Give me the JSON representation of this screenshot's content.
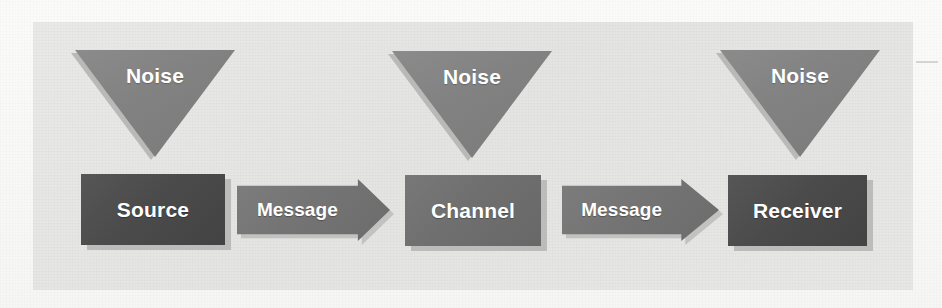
{
  "diagram": {
    "type": "flow-diagram",
    "colors": {
      "page_background": "#fbfbfa",
      "panel_background": "#e6e6e5",
      "node_dark": "#4b4b4b",
      "node_mid": "#6f6f6f",
      "noise_triangle": "#828282",
      "arrow": "#747474",
      "label_text": "#ffffff",
      "shadow": "#bcbcbb"
    },
    "noise_sources": [
      {
        "id": "noise-1",
        "label": "Noise",
        "targets": "Source"
      },
      {
        "id": "noise-2",
        "label": "Noise",
        "targets": "Channel"
      },
      {
        "id": "noise-3",
        "label": "Noise",
        "targets": "Receiver"
      }
    ],
    "nodes": [
      {
        "id": "source",
        "label": "Source",
        "shade": "dark"
      },
      {
        "id": "channel",
        "label": "Channel",
        "shade": "mid"
      },
      {
        "id": "receiver",
        "label": "Receiver",
        "shade": "dark"
      }
    ],
    "connectors": [
      {
        "id": "message-1",
        "label": "Message",
        "from": "Source",
        "to": "Channel"
      },
      {
        "id": "message-2",
        "label": "Message",
        "from": "Channel",
        "to": "Receiver"
      }
    ]
  }
}
